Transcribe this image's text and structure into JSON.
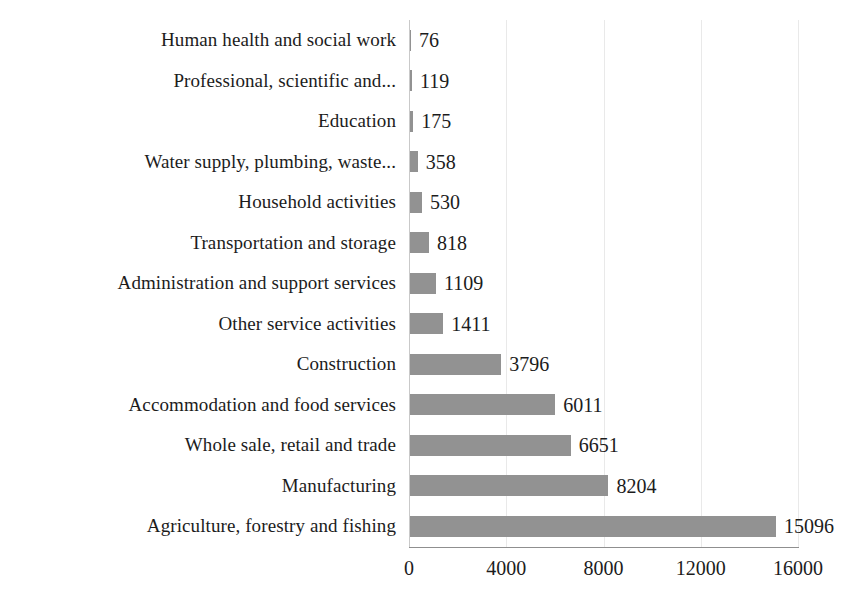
{
  "chart_data": {
    "type": "bar",
    "orientation": "horizontal",
    "title": "",
    "subtitle": "",
    "xlabel": "",
    "ylabel": "",
    "xlim": [
      0,
      16000
    ],
    "xticks": [
      0,
      4000,
      8000,
      12000,
      16000
    ],
    "xtick_labels": [
      "0",
      "4000",
      "8000",
      "12000",
      "16000"
    ],
    "grid": "vertical",
    "legend": "none",
    "bar_color": "#929292",
    "data_labels": true,
    "categories": [
      "Human health and social work",
      "Professional, scientific and...",
      "Education",
      "Water supply, plumbing, waste...",
      "Household activities",
      "Transportation and storage",
      "Administration and support services",
      "Other service activities",
      "Construction",
      "Accommodation and food services",
      "Whole sale, retail and trade",
      "Manufacturing",
      "Agriculture, forestry and fishing"
    ],
    "values": [
      76,
      119,
      175,
      358,
      530,
      818,
      1109,
      1411,
      3796,
      6011,
      6651,
      8204,
      15096
    ],
    "value_labels": [
      "76",
      "119",
      "175",
      "358",
      "530",
      "818",
      "1109",
      "1411",
      "3796",
      "6011",
      "6651",
      "8204",
      "15096"
    ]
  }
}
